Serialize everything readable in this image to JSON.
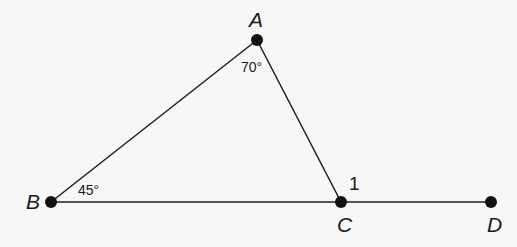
{
  "diagram": {
    "type": "geometry-triangle",
    "points": {
      "A": {
        "label": "A",
        "x": 257,
        "y": 40
      },
      "B": {
        "label": "B",
        "x": 51,
        "y": 202
      },
      "C": {
        "label": "C",
        "x": 341,
        "y": 202
      },
      "D": {
        "label": "D",
        "x": 491,
        "y": 202
      }
    },
    "segments": [
      {
        "from": "A",
        "to": "B"
      },
      {
        "from": "A",
        "to": "C"
      },
      {
        "from": "B",
        "to": "D"
      }
    ],
    "angles": {
      "A": {
        "label": "70°",
        "vertex": "A"
      },
      "B": {
        "label": "45°",
        "vertex": "B"
      },
      "exterior_1": {
        "label": "1",
        "vertex": "C"
      }
    },
    "colors": {
      "line": "#1e1e1e",
      "point": "#111111",
      "background": "#f7f7f7"
    }
  }
}
